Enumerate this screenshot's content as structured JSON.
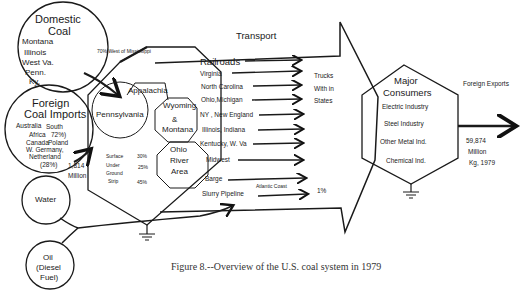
{
  "figure": {
    "caption": "Figure 8.--Overview of the U.S. coal system in 1979"
  },
  "sources": {
    "domestic_coal": {
      "title_line1": "Domestic",
      "title_line2": "Coal",
      "states": [
        "Montana",
        "Illinois",
        "West Va.",
        "Penn.",
        "Ky."
      ]
    },
    "foreign_coal_imports": {
      "title_line1": "Foreign",
      "title_line2": "Coal Imports",
      "origin_a_line1": "Australia",
      "origin_a_line2": "South",
      "origin_a_line3": "Africa",
      "origin_a_share": "72%)",
      "origin_b_line1": "Canada",
      "origin_b_line2": "Poland",
      "origin_b_line3": "W. Germany,",
      "origin_b_line4": "Netherland",
      "origin_b_share": "(28%)",
      "amount_line1": "1,814",
      "amount_line2": "Million"
    },
    "water": {
      "label": "Water"
    },
    "oil": {
      "line1": "Oil",
      "line2": "(Diesel",
      "line3": "Fuel)"
    }
  },
  "annotations": {
    "west_of_mississippi": "70% West of Mississippi"
  },
  "production": {
    "regions": [
      "Appalachia",
      "Pennsylvania",
      "Wyoming",
      "&",
      "Montana",
      "Ohio",
      "River",
      "Area"
    ],
    "mining_methods": [
      {
        "method": "Surface",
        "share": "30%"
      },
      {
        "method": "Under",
        "share": "25%"
      },
      {
        "method": "Ground",
        "share": ""
      },
      {
        "method": "Strip",
        "share": "45%"
      }
    ]
  },
  "transport": {
    "header": "Transport",
    "modes": [
      "Railroads",
      "Virginia",
      "North Carolina",
      "Ohio,Michigan",
      "NY , New England",
      "Illinois, Indiana",
      "Kentucky, W. Va",
      "Midwest",
      "Barge",
      "Slurry Pipeline"
    ],
    "trucks_line1": "Trucks",
    "trucks_line2": "With in",
    "trucks_line3": "States",
    "atlantic_coast": "Atlantic Coast",
    "pipeline_share": "1%"
  },
  "consumers": {
    "title_line1": "Major",
    "title_line2": "Consumers",
    "items": [
      "Electric Industry",
      "Steel Industry",
      "Other Metal Ind.",
      "Chemical Ind."
    ]
  },
  "exports": {
    "label": "Foreign Exports",
    "amount_line1": "59,874",
    "amount_line2": "Million",
    "amount_line3": "Kg, 1979"
  }
}
